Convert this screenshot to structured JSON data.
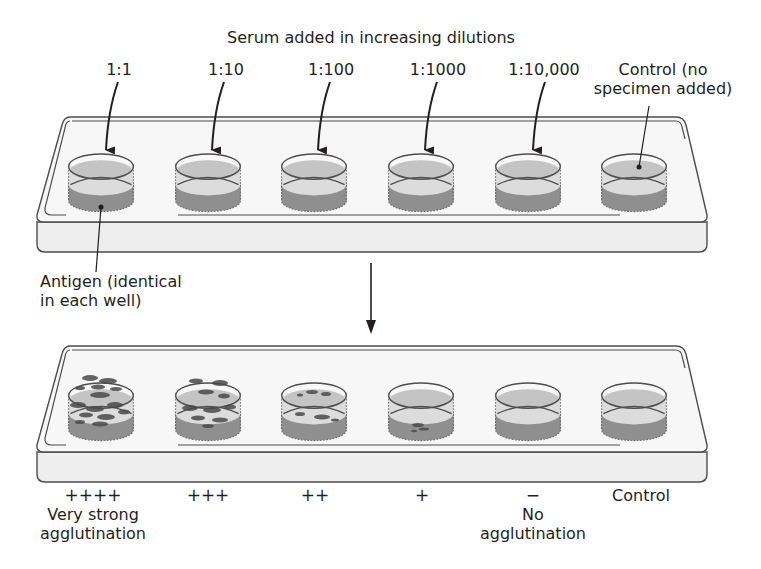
{
  "title": "Serum added in increasing dilutions",
  "dilutions": [
    {
      "label": "1:1"
    },
    {
      "label": "1:10"
    },
    {
      "label": "1:100"
    },
    {
      "label": "1:1000"
    },
    {
      "label": "1:10,000"
    }
  ],
  "control_top": {
    "line1": "Control (no",
    "line2": "specimen added)"
  },
  "antigen_label": {
    "line1": "Antigen (identical",
    "line2": "in each well)"
  },
  "results": [
    {
      "symbol": "++++",
      "desc_line1": "Very strong",
      "desc_line2": "agglutination"
    },
    {
      "symbol": "+++",
      "desc_line1": "",
      "desc_line2": ""
    },
    {
      "symbol": "++",
      "desc_line1": "",
      "desc_line2": ""
    },
    {
      "symbol": "+",
      "desc_line1": "",
      "desc_line2": ""
    },
    {
      "symbol": "−",
      "desc_line1": "No",
      "desc_line2": "agglutination"
    },
    {
      "symbol": "Control",
      "desc_line1": "",
      "desc_line2": ""
    }
  ],
  "colors": {
    "outline": "#4d4d4f",
    "slide_fill": "#f7f7f7",
    "slide_side": "#eeeeee",
    "liquid_top": "#c4c4c4",
    "well_glass": "#dcdcdc",
    "antigen": "#8f8f8f",
    "clumps": "#4a4a4a",
    "text": "#231f20"
  }
}
